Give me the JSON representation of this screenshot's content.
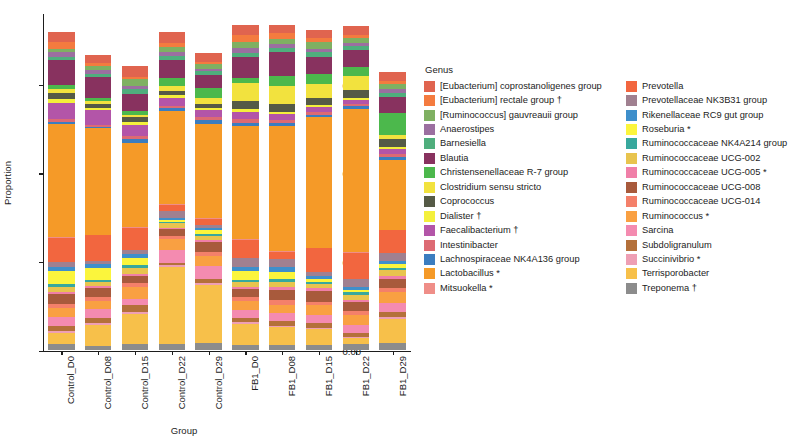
{
  "chart_data": {
    "type": "bar",
    "subtype": "stacked-proportional",
    "title": "",
    "xlabel": "Group",
    "ylabel": "Proportion",
    "ylim": [
      0,
      0.95
    ],
    "y_ticks": [
      "0.00",
      "0.25",
      "0.50",
      "0.75"
    ],
    "y_tick_values": [
      0.0,
      0.25,
      0.5,
      0.75
    ],
    "grid": false,
    "legend_title": "Genus",
    "legend_position": "right",
    "categories": [
      "Control_D0",
      "Control_D08",
      "Control_D15",
      "Control_D22",
      "Control_D29",
      "FB1_D0",
      "FB1_D08",
      "FB1_D15",
      "FB1_D22",
      "FB1_D29"
    ],
    "totals": [
      0.898,
      0.855,
      0.862,
      0.905,
      0.855,
      0.93,
      0.925,
      0.905,
      0.905,
      0.872
    ],
    "series": [
      {
        "name": "[Eubacterium] coprostanoligenes group",
        "color": "#E0644F",
        "values": [
          0.026,
          0.022,
          0.03,
          0.029,
          0.024,
          0.028,
          0.025,
          0.024,
          0.023,
          0.026
        ]
      },
      {
        "name": "[Eubacterium] rectale group †",
        "color": "#F47B3F",
        "values": [
          0.02,
          0.009,
          0.006,
          0.012,
          0.007,
          0.022,
          0.016,
          0.01,
          0.009,
          0.008
        ]
      },
      {
        "name": "[Ruminococcus] gauvreauii group",
        "color": "#7FB062",
        "values": [
          0.01,
          0.013,
          0.018,
          0.015,
          0.012,
          0.017,
          0.014,
          0.019,
          0.015,
          0.014
        ]
      },
      {
        "name": "Anaerostipes",
        "color": "#9B6FA0",
        "values": [
          0.012,
          0.01,
          0.009,
          0.011,
          0.008,
          0.013,
          0.011,
          0.01,
          0.009,
          0.01
        ]
      },
      {
        "name": "Barnesiella",
        "color": "#4FAE7D",
        "values": [
          0.009,
          0.008,
          0.014,
          0.01,
          0.011,
          0.012,
          0.01,
          0.012,
          0.011,
          0.011
        ]
      },
      {
        "name": "Blautia",
        "color": "#88325F",
        "values": [
          0.072,
          0.06,
          0.048,
          0.052,
          0.037,
          0.06,
          0.068,
          0.05,
          0.048,
          0.046
        ]
      },
      {
        "name": "Christensenellaceae R-7 group",
        "color": "#4CB84C",
        "values": [
          0.011,
          0.009,
          0.012,
          0.022,
          0.026,
          0.013,
          0.028,
          0.027,
          0.026,
          0.063
        ]
      },
      {
        "name": "Clostridium sensu stricto",
        "color": "#F2E23E",
        "values": [
          0.012,
          0.009,
          0.007,
          0.014,
          0.018,
          0.052,
          0.052,
          0.041,
          0.038,
          0.012
        ]
      },
      {
        "name": "Coprococcus",
        "color": "#555A46",
        "values": [
          0.016,
          0.011,
          0.013,
          0.013,
          0.011,
          0.02,
          0.022,
          0.02,
          0.024,
          0.022
        ]
      },
      {
        "name": "Dialister †",
        "color": "#F4F03C",
        "values": [
          0.01,
          0.006,
          0.009,
          0.007,
          0.005,
          0.009,
          0.007,
          0.006,
          0.004,
          0.005
        ]
      },
      {
        "name": "Faecalibacterium †",
        "color": "#B355A8",
        "values": [
          0.047,
          0.04,
          0.031,
          0.022,
          0.022,
          0.02,
          0.016,
          0.013,
          0.012,
          0.013
        ]
      },
      {
        "name": "Intestinibacter",
        "color": "#DD6A73",
        "values": [
          0.007,
          0.006,
          0.007,
          0.006,
          0.006,
          0.011,
          0.009,
          0.008,
          0.007,
          0.009
        ]
      },
      {
        "name": "Lachnospiraceae NK4A136 group",
        "color": "#3B7DC0",
        "values": [
          0.008,
          0.005,
          0.012,
          0.01,
          0.013,
          0.008,
          0.009,
          0.007,
          0.008,
          0.01
        ]
      },
      {
        "name": "Lactobacillus *",
        "color": "#F59A28",
        "values": [
          0.318,
          0.3,
          0.238,
          0.262,
          0.266,
          0.32,
          0.352,
          0.368,
          0.404,
          0.196
        ]
      },
      {
        "name": "Mitsuokella *",
        "color": "#EF8E88",
        "values": [
          0.003,
          0.002,
          0.003,
          0.003,
          0.002,
          0.002,
          0.002,
          0.002,
          0.001,
          0.002
        ]
      },
      {
        "name": "Prevotella",
        "color": "#F2663F",
        "values": [
          0.068,
          0.072,
          0.06,
          0.016,
          0.016,
          0.052,
          0.02,
          0.066,
          0.074,
          0.064
        ]
      },
      {
        "name": "Prevotellaceae NK3B31 group",
        "color": "#A08090",
        "values": [
          0.014,
          0.01,
          0.012,
          0.02,
          0.008,
          0.026,
          0.024,
          0.012,
          0.022,
          0.023
        ]
      },
      {
        "name": "Rikenellaceae RC9 gut group",
        "color": "#3E8FCB",
        "values": [
          0.01,
          0.009,
          0.011,
          0.006,
          0.007,
          0.012,
          0.014,
          0.009,
          0.01,
          0.008
        ]
      },
      {
        "name": "Roseburia *",
        "color": "#FBF53C",
        "values": [
          0.038,
          0.034,
          0.02,
          0.004,
          0.01,
          0.023,
          0.02,
          0.008,
          0.006,
          0.01
        ]
      },
      {
        "name": "Ruminococcaceae NK4A214 group",
        "color": "#38A89D",
        "values": [
          0.007,
          0.006,
          0.009,
          0.005,
          0.006,
          0.007,
          0.008,
          0.006,
          0.007,
          0.008
        ]
      },
      {
        "name": "Ruminococcaceae UCG-002",
        "color": "#E8C44E",
        "values": [
          0.014,
          0.012,
          0.016,
          0.012,
          0.013,
          0.013,
          0.015,
          0.012,
          0.014,
          0.016
        ]
      },
      {
        "name": "Ruminococcaceae UCG-005 *",
        "color": "#F07FA8",
        "values": [
          0.006,
          0.005,
          0.006,
          0.005,
          0.006,
          0.006,
          0.007,
          0.006,
          0.005,
          0.007
        ]
      },
      {
        "name": "Ruminococcaceae UCG-008",
        "color": "#A85A3C",
        "values": [
          0.028,
          0.026,
          0.02,
          0.018,
          0.026,
          0.024,
          0.03,
          0.032,
          0.028,
          0.026
        ]
      },
      {
        "name": "Ruminococcaceae UCG-014",
        "color": "#F4806A",
        "values": [
          0.012,
          0.01,
          0.013,
          0.01,
          0.012,
          0.011,
          0.013,
          0.01,
          0.011,
          0.012
        ]
      },
      {
        "name": "Ruminococcus *",
        "color": "#F9A042",
        "values": [
          0.026,
          0.024,
          0.033,
          0.03,
          0.03,
          0.026,
          0.022,
          0.026,
          0.026,
          0.03
        ]
      },
      {
        "name": "Sarcina",
        "color": "#F48BB0",
        "values": [
          0.026,
          0.024,
          0.018,
          0.036,
          0.036,
          0.021,
          0.022,
          0.024,
          0.024,
          0.026
        ]
      },
      {
        "name": "Subdoligranulum",
        "color": "#B4703A",
        "values": [
          0.014,
          0.016,
          0.018,
          0.008,
          0.012,
          0.013,
          0.014,
          0.013,
          0.012,
          0.016
        ]
      },
      {
        "name": "Succinivibrio *",
        "color": "#EE9FB4",
        "values": [
          0.005,
          0.004,
          0.005,
          0.004,
          0.004,
          0.005,
          0.004,
          0.004,
          0.003,
          0.005
        ]
      },
      {
        "name": "Terrisporobacter",
        "color": "#F7C04A",
        "values": [
          0.031,
          0.06,
          0.086,
          0.218,
          0.164,
          0.06,
          0.05,
          0.044,
          0.016,
          0.068
        ]
      },
      {
        "name": "Treponema †",
        "color": "#8C8C8C",
        "values": [
          0.018,
          0.013,
          0.018,
          0.018,
          0.021,
          0.014,
          0.016,
          0.016,
          0.018,
          0.02
        ]
      }
    ]
  },
  "axes": {
    "y_title": "Proportion",
    "x_title": "Group",
    "y_tick_labels": [
      "0.75",
      "0.50",
      "0.25",
      "0.00"
    ],
    "x_tick_labels": [
      "Control_D0",
      "Control_D08",
      "Control_D15",
      "Control_D22",
      "Control_D29",
      "FB1_D0",
      "FB1_D08",
      "FB1_D15",
      "FB1_D22",
      "FB1_D29"
    ]
  },
  "legend": {
    "title": "Genus",
    "column1": [
      {
        "label": "[Eubacterium] coprostanoligenes group",
        "color": "#E0644F"
      },
      {
        "label": "[Eubacterium] rectale group †",
        "color": "#F47B3F"
      },
      {
        "label": "[Ruminococcus] gauvreauii group",
        "color": "#7FB062"
      },
      {
        "label": "Anaerostipes",
        "color": "#9B6FA0"
      },
      {
        "label": "Barnesiella",
        "color": "#4FAE7D"
      },
      {
        "label": "Blautia",
        "color": "#88325F"
      },
      {
        "label": "Christensenellaceae R-7 group",
        "color": "#4CB84C"
      },
      {
        "label": "Clostridium sensu stricto",
        "color": "#F2E23E"
      },
      {
        "label": "Coprococcus",
        "color": "#555A46"
      },
      {
        "label": "Dialister †",
        "color": "#F4F03C"
      },
      {
        "label": "Faecalibacterium †",
        "color": "#B355A8"
      },
      {
        "label": "Intestinibacter",
        "color": "#DD6A73"
      },
      {
        "label": "Lachnospiraceae NK4A136 group",
        "color": "#3B7DC0"
      },
      {
        "label": "Lactobacillus *",
        "color": "#F59A28"
      },
      {
        "label": "Mitsuokella *",
        "color": "#EF8E88"
      }
    ],
    "column2": [
      {
        "label": "Prevotella",
        "color": "#F2663F"
      },
      {
        "label": "Prevotellaceae NK3B31 group",
        "color": "#A08090"
      },
      {
        "label": "Rikenellaceae RC9 gut group",
        "color": "#3E8FCB"
      },
      {
        "label": "Roseburia *",
        "color": "#FBF53C"
      },
      {
        "label": "Ruminococcaceae NK4A214 group",
        "color": "#38A89D"
      },
      {
        "label": "Ruminococcaceae UCG-002",
        "color": "#E8C44E"
      },
      {
        "label": "Ruminococcaceae UCG-005 *",
        "color": "#F07FA8"
      },
      {
        "label": "Ruminococcaceae UCG-008",
        "color": "#A85A3C"
      },
      {
        "label": "Ruminococcaceae UCG-014",
        "color": "#F4806A"
      },
      {
        "label": "Ruminococcus *",
        "color": "#F9A042"
      },
      {
        "label": "Sarcina",
        "color": "#F48BB0"
      },
      {
        "label": "Subdoligranulum",
        "color": "#B4703A"
      },
      {
        "label": "Succinivibrio *",
        "color": "#EE9FB4"
      },
      {
        "label": "Terrisporobacter",
        "color": "#F7C04A"
      },
      {
        "label": "Treponema †",
        "color": "#8C8C8C"
      }
    ]
  }
}
